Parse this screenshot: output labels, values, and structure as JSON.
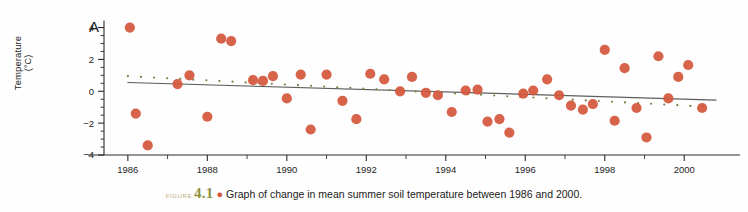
{
  "panel": {
    "label": "A"
  },
  "axes": {
    "y_title_main": "Temperature",
    "y_title_unit": "(°C)",
    "y_ticks": [
      "4",
      "2",
      "0",
      "−2",
      "−4"
    ],
    "x_ticks": [
      "1986",
      "1988",
      "1990",
      "1992",
      "1994",
      "1996",
      "1998",
      "2000"
    ]
  },
  "caption": {
    "figure_word": "Figure",
    "figure_number": "4.1",
    "bullet": "●",
    "text": "Graph of change in mean summer soil temperature between 1986 and 2000."
  },
  "colors": {
    "marker": "#d4573c",
    "solid_trend": "#5a5f5c",
    "dotted_trend": "#7d7f49",
    "axis": "#2b2b2b",
    "figure_word": "#b9ad76",
    "figure_number": "#8f8f3f"
  },
  "chart_data": {
    "type": "scatter",
    "title": "Graph of change in mean summer soil temperature between 1986 and 2000.",
    "xlabel": "",
    "ylabel": "Temperature (°C)",
    "xlim": [
      1985.4,
      2000.9
    ],
    "ylim": [
      -4,
      4.6
    ],
    "grid": false,
    "legend": "none",
    "x_tick_values": [
      1986,
      1988,
      1990,
      1992,
      1994,
      1996,
      1998,
      2000
    ],
    "x_minor_tick_values": [
      1987,
      1989,
      1991,
      1993,
      1995,
      1997,
      1999
    ],
    "y_tick_values": [
      4,
      2,
      0,
      -2,
      -4
    ],
    "points": [
      [
        1986.05,
        4.0
      ],
      [
        1986.2,
        -1.4
      ],
      [
        1986.5,
        -3.4
      ],
      [
        1987.25,
        0.45
      ],
      [
        1987.55,
        1.0
      ],
      [
        1988.0,
        -1.6
      ],
      [
        1988.35,
        3.3
      ],
      [
        1988.6,
        3.15
      ],
      [
        1989.15,
        0.7
      ],
      [
        1989.4,
        0.65
      ],
      [
        1989.65,
        0.95
      ],
      [
        1990.0,
        -0.45
      ],
      [
        1990.35,
        1.05
      ],
      [
        1990.6,
        -2.4
      ],
      [
        1991.0,
        1.05
      ],
      [
        1991.4,
        -0.6
      ],
      [
        1991.75,
        -1.75
      ],
      [
        1992.1,
        1.1
      ],
      [
        1992.45,
        0.75
      ],
      [
        1992.85,
        0.0
      ],
      [
        1993.15,
        0.9
      ],
      [
        1993.5,
        -0.1
      ],
      [
        1993.8,
        -0.25
      ],
      [
        1994.15,
        -1.3
      ],
      [
        1994.5,
        0.05
      ],
      [
        1994.8,
        0.1
      ],
      [
        1995.05,
        -1.9
      ],
      [
        1995.35,
        -1.75
      ],
      [
        1995.6,
        -2.6
      ],
      [
        1995.95,
        -0.15
      ],
      [
        1996.2,
        0.05
      ],
      [
        1996.55,
        0.75
      ],
      [
        1996.85,
        -0.25
      ],
      [
        1997.15,
        -0.9
      ],
      [
        1997.45,
        -1.15
      ],
      [
        1997.7,
        -0.8
      ],
      [
        1998.0,
        2.6
      ],
      [
        1998.25,
        -1.85
      ],
      [
        1998.5,
        1.45
      ],
      [
        1998.8,
        -1.05
      ],
      [
        1999.05,
        -2.9
      ],
      [
        1999.35,
        2.2
      ],
      [
        1999.6,
        -0.45
      ],
      [
        1999.85,
        0.9
      ],
      [
        2000.1,
        1.65
      ],
      [
        2000.45,
        -1.05
      ]
    ],
    "series": [
      {
        "name": "solid-trend-line",
        "type": "line",
        "style": "solid",
        "x": [
          1986.0,
          2000.8
        ],
        "y": [
          0.55,
          -0.55
        ]
      },
      {
        "name": "dotted-trend-line",
        "type": "line",
        "style": "dotted",
        "x": [
          1986.0,
          2000.8
        ],
        "y": [
          0.95,
          -1.0
        ]
      }
    ]
  }
}
